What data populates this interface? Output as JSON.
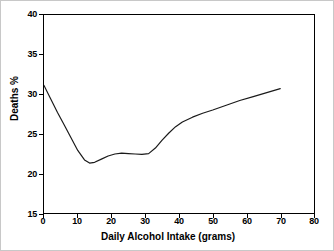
{
  "chart_data": {
    "type": "line",
    "title": "",
    "xlabel": "Daily Alcohol Intake (grams)",
    "ylabel": "Deaths %",
    "xlim": [
      0,
      80
    ],
    "ylim": [
      15,
      40
    ],
    "xticks": [
      "0",
      "10",
      "20",
      "30",
      "40",
      "50",
      "60",
      "70",
      "80"
    ],
    "yticks": [
      "15",
      "20",
      "25",
      "30",
      "35",
      "40"
    ],
    "xtick_values": [
      0,
      10,
      20,
      30,
      40,
      50,
      60,
      70,
      80
    ],
    "ytick_values": [
      15,
      20,
      25,
      30,
      35,
      40
    ],
    "grid": false,
    "legend": false,
    "legend_position": "none",
    "line_color": "#1a1a1a",
    "background_color": "#ffffff",
    "series": [
      {
        "name": "Deaths %",
        "x": [
          0,
          2,
          4,
          6,
          8,
          10,
          12,
          13.5,
          15,
          17,
          19,
          21,
          23,
          25,
          27,
          29,
          31,
          33,
          35,
          37,
          39,
          41,
          44,
          47,
          50,
          54,
          58,
          62,
          66,
          70
        ],
        "values": [
          31.1,
          29.4,
          27.7,
          26.1,
          24.5,
          22.9,
          21.7,
          21.3,
          21.4,
          21.8,
          22.2,
          22.45,
          22.55,
          22.5,
          22.45,
          22.4,
          22.5,
          23.2,
          24.2,
          25.1,
          25.9,
          26.5,
          27.1,
          27.6,
          28.0,
          28.6,
          29.2,
          29.7,
          30.2,
          30.7
        ]
      }
    ],
    "annotations": []
  }
}
